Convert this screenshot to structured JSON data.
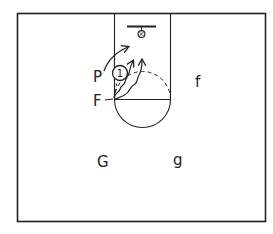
{
  "diagram": {
    "type": "basketball half-court play diagram",
    "colors": {
      "ink": "#222222",
      "background": "#ffffff"
    },
    "players": [
      {
        "id": "P",
        "label": "P",
        "role": "offense"
      },
      {
        "id": "F",
        "label": "F",
        "role": "offense"
      },
      {
        "id": "f",
        "label": "f",
        "role": "offense"
      },
      {
        "id": "G",
        "label": "G",
        "role": "offense"
      },
      {
        "id": "g",
        "label": "g",
        "role": "offense"
      }
    ],
    "defender": {
      "label": "1",
      "shape": "circle"
    },
    "movements": [
      {
        "from": "P",
        "to": "basket-left",
        "style": "solid-arrow"
      },
      {
        "from": "F",
        "to": "lane-middle",
        "style": "wavy-arrow"
      },
      {
        "from": "F",
        "to": "lane-right",
        "style": "wavy-arrow"
      },
      {
        "from": "F",
        "to": "basket",
        "style": "dashed-path"
      }
    ]
  }
}
